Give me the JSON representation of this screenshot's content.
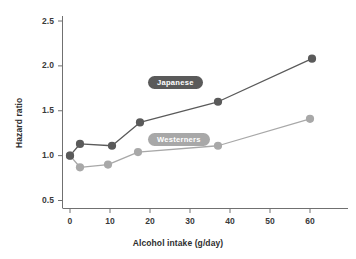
{
  "chart_data": {
    "type": "line",
    "title": "",
    "xlabel": "Alcohol intake (g/day)",
    "ylabel": "Hazard ratio",
    "xlim": [
      -2,
      68
    ],
    "ylim": [
      0.44,
      2.62
    ],
    "xticks": [
      0,
      10,
      20,
      30,
      40,
      50,
      60
    ],
    "xtick_labels": [
      "0",
      "10",
      "20",
      "30",
      "40",
      "50",
      "60"
    ],
    "yticks": [
      0.5,
      1.0,
      1.5,
      2.0,
      2.5
    ],
    "ytick_labels": [
      "0.5",
      "1.0",
      "1.5",
      "2.0",
      "2.5"
    ],
    "grid": false,
    "legend_position": "inline-labels",
    "series": [
      {
        "name": "Japanese",
        "color": "#5a5a5a",
        "marker": "circle",
        "x": [
          0,
          2.5,
          10.5,
          17.5,
          37,
          60.5
        ],
        "y": [
          1.0,
          1.13,
          1.11,
          1.37,
          1.6,
          2.08
        ]
      },
      {
        "name": "Westerners",
        "color": "#a8a8a8",
        "marker": "circle",
        "x": [
          0,
          2.5,
          9.5,
          17,
          37,
          60
        ],
        "y": [
          1.0,
          0.87,
          0.9,
          1.04,
          1.11,
          1.41
        ]
      }
    ],
    "annotations": [
      {
        "text": "Japanese",
        "x": 26,
        "y": 1.82,
        "style": "pill",
        "color": "#5a5a5a"
      },
      {
        "text": "Westerners",
        "x": 26,
        "y": 1.18,
        "style": "pill",
        "color": "#a8a8a8"
      }
    ]
  },
  "axes": {
    "x_title": "Alcohol intake (g/day)",
    "y_title": "Hazard ratio",
    "x_tick_labels": [
      "0",
      "10",
      "20",
      "30",
      "40",
      "50",
      "60"
    ],
    "y_tick_labels": [
      "2.5",
      "2.0",
      "1.5",
      "1.0",
      "0.5"
    ]
  },
  "legend": {
    "japanese_label": "Japanese",
    "westerners_label": "Westerners"
  },
  "colors": {
    "japanese": "#5a5a5a",
    "westerners": "#a8a8a8",
    "axis": "#6e6e6e",
    "text": "#333333"
  }
}
